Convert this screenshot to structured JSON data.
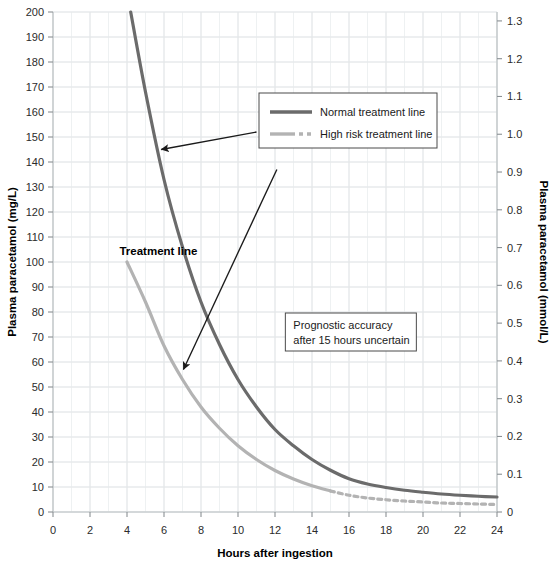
{
  "chart_data": {
    "type": "line",
    "title": "",
    "xlabel": "Hours after ingestion",
    "ylabel": "Plasma paracetamol (mg/L)",
    "ylabel_right": "Plasma paracetamol (mmol/L)",
    "xlim": [
      0,
      24
    ],
    "ylim": [
      0,
      200
    ],
    "ylim_right": [
      0,
      1.3
    ],
    "grid": true,
    "x_ticks": [
      0,
      2,
      4,
      6,
      8,
      10,
      12,
      14,
      16,
      18,
      20,
      22,
      24
    ],
    "x_tick_labels": [
      "0",
      "2",
      "4",
      "6",
      "8",
      "10",
      "12",
      "14",
      "16",
      "18",
      "20",
      "22",
      "24"
    ],
    "x_minor_step": 1,
    "y_ticks": [
      0,
      10,
      20,
      30,
      40,
      50,
      60,
      70,
      80,
      90,
      100,
      110,
      120,
      130,
      140,
      150,
      160,
      170,
      180,
      190,
      200
    ],
    "y_tick_labels": [
      "0",
      "10",
      "20",
      "30",
      "40",
      "50",
      "60",
      "70",
      "80",
      "90",
      "100",
      "110",
      "120",
      "130",
      "140",
      "150",
      "160",
      "170",
      "180",
      "190",
      "200"
    ],
    "y_right_ticks": [
      0,
      0.1,
      0.2,
      0.3,
      0.4,
      0.5,
      0.6,
      0.7,
      0.8,
      0.9,
      1.0,
      1.1,
      1.2,
      1.3
    ],
    "y_right_tick_labels": [
      "0",
      "0.1",
      "0.2",
      "0.3",
      "0.4",
      "0.5",
      "0.6",
      "0.7",
      "0.8",
      "0.9",
      "1.0",
      "1.1",
      "1.2",
      "1.3"
    ],
    "legend_position": "upper-center-right",
    "series": [
      {
        "name": "Normal treatment line",
        "color": "#6b6b6b",
        "style": "solid",
        "x": [
          4.2,
          5,
          6,
          7,
          8,
          9,
          10,
          11,
          12,
          13,
          14,
          15,
          16,
          17,
          18,
          19,
          20,
          21,
          22,
          23,
          24
        ],
        "y": [
          200,
          168,
          133,
          106,
          84,
          67,
          53,
          42,
          33,
          26.5,
          21,
          16.7,
          13.3,
          11.2,
          9.8,
          8.7,
          7.9,
          7.2,
          6.7,
          6.3,
          6.0
        ]
      },
      {
        "name": "High risk treatment line",
        "color": "#b3b3b3",
        "style": "solid-then-dashed",
        "dash_start_x": 15,
        "x": [
          4,
          5,
          6,
          7,
          8,
          9,
          10,
          11,
          12,
          13,
          14,
          15,
          16,
          17,
          18,
          19,
          20,
          21,
          22,
          23,
          24
        ],
        "y": [
          100,
          84,
          66.5,
          53,
          42,
          33.5,
          26.5,
          21,
          16.6,
          13.2,
          10.5,
          8.4,
          6.7,
          5.6,
          4.9,
          4.4,
          4.0,
          3.6,
          3.4,
          3.2,
          3.0
        ]
      }
    ],
    "annotations": [
      {
        "name": "treatment-line-label",
        "text": "Treatment line",
        "x": 5.7,
        "y": 103
      },
      {
        "name": "prognostic-note",
        "lines": [
          "Prognostic accuracy",
          "after 15 hours uncertain"
        ],
        "x": 16.1,
        "y": 72
      }
    ],
    "arrows": [
      {
        "name": "arrow-to-normal-line",
        "from": [
          11.0,
          152
        ],
        "to": [
          5.85,
          145
        ]
      },
      {
        "name": "arrow-to-high-risk-line",
        "from": [
          12.1,
          137
        ],
        "to": [
          7.05,
          57
        ]
      }
    ]
  },
  "legend": {
    "items": [
      {
        "label": "Normal treatment line",
        "color": "#6b6b6b",
        "style": "solid"
      },
      {
        "label": "High risk treatment line",
        "color": "#b3b3b3",
        "style": "dashed"
      }
    ]
  },
  "colors": {
    "background": "#ffffff",
    "grid_major": "#e3e6e8",
    "grid_minor": "#eef1f2",
    "axis": "#bcc1c4",
    "text": "#1a1a1a",
    "normal_line": "#6b6b6b",
    "high_risk_line": "#b3b3b3",
    "arrow": "#1a1a1a",
    "box_border": "#4a4a4a"
  }
}
